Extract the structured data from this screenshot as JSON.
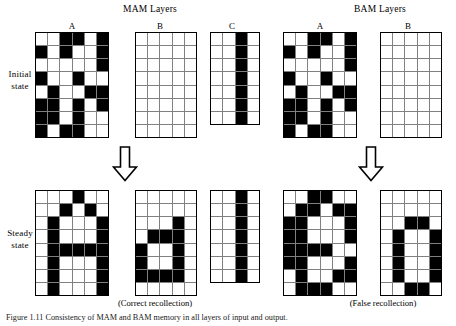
{
  "figure": {
    "group_titles": [
      {
        "label": "MAM Layers"
      },
      {
        "label": "BAM Layers"
      }
    ],
    "column_letters": [
      "A",
      "B",
      "C",
      "A",
      "B"
    ],
    "row_labels": [
      {
        "line1": "Initial",
        "line2": "state"
      },
      {
        "line1": "Steady",
        "line2": "state"
      }
    ],
    "notes": [
      {
        "label": "(Correct recollection)"
      },
      {
        "label": "(False recollection)"
      }
    ],
    "caption": "Figure 1.11   Consistency of MAM and BAM memory in all layers of input and output.",
    "arrow_icon": "down-arrow-icon",
    "colors": {
      "cell_on": "#000000",
      "cell_off": "#ffffff",
      "gridline": "#808080",
      "border": "#000000",
      "text": "#000000"
    }
  },
  "chart_data": {
    "type": "heatmap",
    "xlabel": "",
    "ylabel": "",
    "grid": true,
    "legend": "none",
    "panels": [
      {
        "group": "MAM Layers",
        "layer": "A",
        "state": "Initial state",
        "cols": 6,
        "rows": 8,
        "cells": [
          [
            0,
            0,
            1,
            1,
            0,
            1
          ],
          [
            1,
            0,
            1,
            0,
            0,
            1
          ],
          [
            0,
            0,
            0,
            0,
            0,
            1
          ],
          [
            1,
            0,
            0,
            1,
            0,
            0
          ],
          [
            0,
            1,
            0,
            0,
            1,
            1
          ],
          [
            1,
            1,
            0,
            1,
            0,
            1
          ],
          [
            1,
            1,
            0,
            1,
            0,
            0
          ],
          [
            1,
            0,
            1,
            1,
            0,
            0
          ]
        ]
      },
      {
        "group": "MAM Layers",
        "layer": "B",
        "state": "Initial state",
        "cols": 5,
        "rows": 8,
        "cells": [
          [
            0,
            0,
            0,
            0,
            0
          ],
          [
            0,
            0,
            0,
            0,
            0
          ],
          [
            0,
            0,
            0,
            0,
            0
          ],
          [
            0,
            0,
            0,
            0,
            0
          ],
          [
            0,
            0,
            0,
            0,
            0
          ],
          [
            0,
            0,
            0,
            0,
            0
          ],
          [
            0,
            0,
            0,
            0,
            0
          ],
          [
            0,
            0,
            0,
            0,
            0
          ]
        ]
      },
      {
        "group": "MAM Layers",
        "layer": "C",
        "state": "Initial state",
        "cols": 4,
        "rows": 7,
        "cells": [
          [
            0,
            0,
            1,
            0
          ],
          [
            0,
            0,
            1,
            0
          ],
          [
            0,
            0,
            1,
            0
          ],
          [
            0,
            0,
            1,
            0
          ],
          [
            0,
            0,
            1,
            0
          ],
          [
            0,
            0,
            1,
            0
          ],
          [
            0,
            0,
            1,
            0
          ]
        ]
      },
      {
        "group": "MAM Layers",
        "layer": "A",
        "state": "Steady state",
        "cols": 6,
        "rows": 8,
        "cells": [
          [
            0,
            0,
            0,
            1,
            0,
            0
          ],
          [
            0,
            0,
            1,
            0,
            1,
            0
          ],
          [
            0,
            1,
            0,
            0,
            0,
            1
          ],
          [
            0,
            1,
            0,
            0,
            0,
            1
          ],
          [
            0,
            1,
            1,
            1,
            1,
            1
          ],
          [
            0,
            1,
            0,
            0,
            0,
            1
          ],
          [
            0,
            1,
            0,
            0,
            0,
            1
          ],
          [
            0,
            1,
            0,
            0,
            0,
            1
          ]
        ]
      },
      {
        "group": "MAM Layers",
        "layer": "B",
        "state": "Steady state",
        "cols": 5,
        "rows": 8,
        "cells": [
          [
            0,
            0,
            0,
            0,
            0
          ],
          [
            0,
            0,
            0,
            0,
            0
          ],
          [
            0,
            0,
            0,
            1,
            0
          ],
          [
            0,
            1,
            1,
            1,
            0
          ],
          [
            1,
            0,
            0,
            1,
            0
          ],
          [
            1,
            0,
            0,
            1,
            0
          ],
          [
            1,
            1,
            1,
            1,
            0
          ],
          [
            0,
            0,
            0,
            0,
            0
          ]
        ]
      },
      {
        "group": "MAM Layers",
        "layer": "C",
        "state": "Steady state",
        "cols": 4,
        "rows": 7,
        "cells": [
          [
            0,
            0,
            1,
            0
          ],
          [
            0,
            0,
            1,
            0
          ],
          [
            0,
            0,
            1,
            0
          ],
          [
            0,
            0,
            1,
            0
          ],
          [
            0,
            0,
            1,
            0
          ],
          [
            0,
            0,
            1,
            0
          ],
          [
            0,
            0,
            1,
            0
          ]
        ]
      },
      {
        "group": "BAM Layers",
        "layer": "A",
        "state": "Initial state",
        "cols": 6,
        "rows": 8,
        "cells": [
          [
            0,
            0,
            1,
            1,
            0,
            1
          ],
          [
            1,
            0,
            1,
            0,
            0,
            1
          ],
          [
            0,
            0,
            0,
            0,
            0,
            1
          ],
          [
            1,
            0,
            0,
            1,
            0,
            0
          ],
          [
            0,
            1,
            0,
            0,
            1,
            1
          ],
          [
            1,
            1,
            0,
            1,
            0,
            1
          ],
          [
            1,
            1,
            0,
            1,
            0,
            0
          ],
          [
            1,
            0,
            1,
            1,
            0,
            0
          ]
        ]
      },
      {
        "group": "BAM Layers",
        "layer": "B",
        "state": "Initial state",
        "cols": 5,
        "rows": 8,
        "cells": [
          [
            0,
            0,
            0,
            0,
            0
          ],
          [
            0,
            0,
            0,
            0,
            0
          ],
          [
            0,
            0,
            0,
            0,
            0
          ],
          [
            0,
            0,
            0,
            0,
            0
          ],
          [
            0,
            0,
            0,
            0,
            0
          ],
          [
            0,
            0,
            0,
            0,
            0
          ],
          [
            0,
            0,
            0,
            0,
            0
          ],
          [
            0,
            0,
            0,
            0,
            0
          ]
        ]
      },
      {
        "group": "BAM Layers",
        "layer": "A",
        "state": "Steady state",
        "cols": 6,
        "rows": 8,
        "cells": [
          [
            0,
            0,
            1,
            1,
            0,
            0
          ],
          [
            0,
            1,
            1,
            0,
            1,
            1
          ],
          [
            1,
            1,
            0,
            0,
            0,
            1
          ],
          [
            1,
            1,
            0,
            0,
            0,
            1
          ],
          [
            1,
            1,
            1,
            1,
            0,
            0
          ],
          [
            1,
            1,
            0,
            0,
            0,
            1
          ],
          [
            0,
            1,
            0,
            0,
            1,
            1
          ],
          [
            0,
            1,
            1,
            1,
            0,
            0
          ]
        ]
      },
      {
        "group": "BAM Layers",
        "layer": "B",
        "state": "Steady state",
        "cols": 5,
        "rows": 8,
        "cells": [
          [
            0,
            0,
            0,
            0,
            0
          ],
          [
            0,
            0,
            0,
            0,
            0
          ],
          [
            0,
            0,
            1,
            1,
            0
          ],
          [
            0,
            1,
            0,
            0,
            1
          ],
          [
            0,
            1,
            0,
            0,
            1
          ],
          [
            0,
            1,
            0,
            0,
            1
          ],
          [
            0,
            1,
            0,
            0,
            1
          ],
          [
            0,
            0,
            1,
            1,
            0
          ]
        ]
      }
    ]
  }
}
